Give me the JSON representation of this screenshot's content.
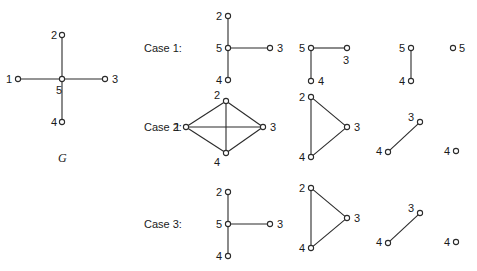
{
  "figure": {
    "title_graph_label": "G",
    "case_labels": [
      "Case 1:",
      "Case 2:",
      "Case 3:"
    ],
    "node_radius": 2.6,
    "colors": {
      "edge": "#2b2b2b",
      "node_fill": "#ffffff",
      "text": "#1a1a1a",
      "background": "#ffffff"
    },
    "graphs": [
      {
        "id": "G",
        "caption": "G",
        "nodes": [
          {
            "label": "5",
            "x": 62,
            "y": 79,
            "lx": 56,
            "ly": 94
          },
          {
            "label": "2",
            "x": 62,
            "y": 35,
            "lx": 51,
            "ly": 39
          },
          {
            "label": "4",
            "x": 62,
            "y": 122,
            "lx": 51,
            "ly": 126
          },
          {
            "label": "1",
            "x": 18,
            "y": 79,
            "lx": 6,
            "ly": 83
          },
          {
            "label": "3",
            "x": 105,
            "y": 79,
            "lx": 112,
            "ly": 83
          }
        ],
        "edges": [
          [
            0,
            1
          ],
          [
            0,
            2
          ],
          [
            0,
            3
          ],
          [
            0,
            4
          ]
        ]
      },
      {
        "id": "case1-a",
        "caption": "",
        "nodes": [
          {
            "label": "2",
            "x": 228,
            "y": 16,
            "lx": 216,
            "ly": 20
          },
          {
            "label": "5",
            "x": 228,
            "y": 48,
            "lx": 216,
            "ly": 52
          },
          {
            "label": "4",
            "x": 228,
            "y": 80,
            "lx": 216,
            "ly": 84
          },
          {
            "label": "3",
            "x": 270,
            "y": 48,
            "lx": 277,
            "ly": 52
          }
        ],
        "edges": [
          [
            0,
            1
          ],
          [
            1,
            2
          ],
          [
            1,
            3
          ]
        ]
      },
      {
        "id": "case1-b",
        "caption": "",
        "nodes": [
          {
            "label": "5",
            "x": 311,
            "y": 48,
            "lx": 299,
            "ly": 52
          },
          {
            "label": "3",
            "x": 347,
            "y": 48,
            "lx": 343,
            "ly": 64
          },
          {
            "label": "4",
            "x": 311,
            "y": 81,
            "lx": 318,
            "ly": 85
          }
        ],
        "edges": [
          [
            0,
            1
          ],
          [
            0,
            2
          ]
        ]
      },
      {
        "id": "case1-c",
        "caption": "",
        "nodes": [
          {
            "label": "5",
            "x": 411,
            "y": 48,
            "lx": 399,
            "ly": 52
          },
          {
            "label": "4",
            "x": 411,
            "y": 81,
            "lx": 399,
            "ly": 85
          }
        ],
        "edges": [
          [
            0,
            1
          ]
        ]
      },
      {
        "id": "case1-d",
        "caption": "",
        "nodes": [
          {
            "label": "5",
            "x": 453,
            "y": 48,
            "lx": 459,
            "ly": 52
          }
        ],
        "edges": []
      },
      {
        "id": "case2-a",
        "caption": "",
        "nodes": [
          {
            "label": "2",
            "x": 226,
            "y": 101,
            "lx": 214,
            "ly": 99
          },
          {
            "label": "1",
            "x": 186,
            "y": 127,
            "lx": 174,
            "ly": 131
          },
          {
            "label": "3",
            "x": 263,
            "y": 127,
            "lx": 270,
            "ly": 131
          },
          {
            "label": "4",
            "x": 226,
            "y": 153,
            "lx": 214,
            "ly": 166
          }
        ],
        "edges": [
          [
            0,
            1
          ],
          [
            0,
            2
          ],
          [
            1,
            3
          ],
          [
            2,
            3
          ],
          [
            1,
            2
          ],
          [
            0,
            3
          ]
        ]
      },
      {
        "id": "case2-b",
        "caption": "",
        "nodes": [
          {
            "label": "2",
            "x": 311,
            "y": 97,
            "lx": 299,
            "ly": 101
          },
          {
            "label": "3",
            "x": 347,
            "y": 127,
            "lx": 354,
            "ly": 131
          },
          {
            "label": "4",
            "x": 311,
            "y": 157,
            "lx": 299,
            "ly": 161
          }
        ],
        "edges": [
          [
            0,
            1
          ],
          [
            0,
            2
          ],
          [
            1,
            2
          ]
        ]
      },
      {
        "id": "case2-c",
        "caption": "",
        "nodes": [
          {
            "label": "3",
            "x": 420,
            "y": 122,
            "lx": 408,
            "ly": 121
          },
          {
            "label": "4",
            "x": 388,
            "y": 152,
            "lx": 376,
            "ly": 155
          }
        ],
        "edges": [
          [
            0,
            1
          ]
        ]
      },
      {
        "id": "case2-d",
        "caption": "",
        "nodes": [
          {
            "label": "4",
            "x": 456,
            "y": 151,
            "lx": 444,
            "ly": 155
          }
        ],
        "edges": []
      },
      {
        "id": "case3-a",
        "caption": "",
        "nodes": [
          {
            "label": "2",
            "x": 228,
            "y": 192,
            "lx": 216,
            "ly": 196
          },
          {
            "label": "5",
            "x": 228,
            "y": 224,
            "lx": 216,
            "ly": 228
          },
          {
            "label": "4",
            "x": 228,
            "y": 256,
            "lx": 216,
            "ly": 260
          },
          {
            "label": "3",
            "x": 270,
            "y": 224,
            "lx": 277,
            "ly": 228
          }
        ],
        "edges": [
          [
            0,
            1
          ],
          [
            1,
            2
          ],
          [
            1,
            3
          ]
        ]
      },
      {
        "id": "case3-b",
        "caption": "",
        "nodes": [
          {
            "label": "2",
            "x": 311,
            "y": 188,
            "lx": 299,
            "ly": 192
          },
          {
            "label": "3",
            "x": 347,
            "y": 218,
            "lx": 354,
            "ly": 222
          },
          {
            "label": "4",
            "x": 311,
            "y": 248,
            "lx": 299,
            "ly": 252
          }
        ],
        "edges": [
          [
            0,
            1
          ],
          [
            0,
            2
          ],
          [
            1,
            2
          ]
        ]
      },
      {
        "id": "case3-c",
        "caption": "",
        "nodes": [
          {
            "label": "3",
            "x": 420,
            "y": 213,
            "lx": 408,
            "ly": 212
          },
          {
            "label": "4",
            "x": 388,
            "y": 243,
            "lx": 376,
            "ly": 246
          }
        ],
        "edges": [
          [
            0,
            1
          ]
        ]
      },
      {
        "id": "case3-d",
        "caption": "",
        "nodes": [
          {
            "label": "4",
            "x": 456,
            "y": 242,
            "lx": 444,
            "ly": 246
          }
        ],
        "edges": []
      }
    ],
    "case_label_positions": [
      {
        "text": "Case 1:",
        "x": 144,
        "y": 52
      },
      {
        "text": "Case 2:",
        "x": 144,
        "y": 131
      },
      {
        "text": "Case 3:",
        "x": 144,
        "y": 228
      }
    ],
    "graph_caption_position": {
      "text": "G",
      "x": 58,
      "y": 162
    }
  }
}
